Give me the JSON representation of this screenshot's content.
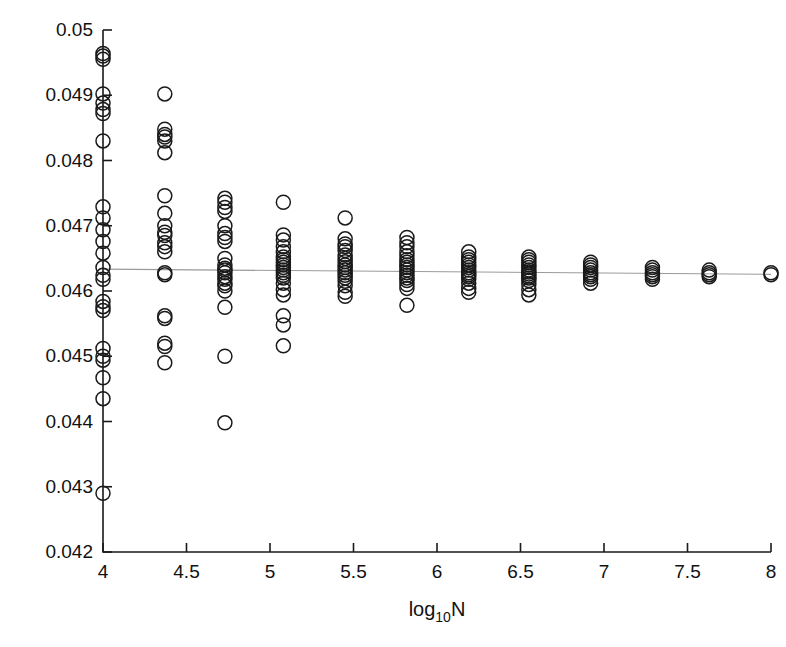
{
  "chart_data": {
    "type": "scatter",
    "title": "",
    "subtitle": "",
    "xlabel": "log10N",
    "xlabel_parts": {
      "base": "log",
      "subscript": "10",
      "tail": "N"
    },
    "ylabel": "",
    "xlim": [
      4,
      8
    ],
    "ylim": [
      0.042,
      0.05
    ],
    "xticks": [
      4,
      4.5,
      5,
      5.5,
      6,
      6.5,
      7,
      7.5,
      8
    ],
    "xtick_labels": [
      "4",
      "4.5",
      "5",
      "5.5",
      "6",
      "6.5",
      "7",
      "7.5",
      "8"
    ],
    "yticks": [
      0.042,
      0.043,
      0.044,
      0.045,
      0.046,
      0.047,
      0.048,
      0.049,
      0.05
    ],
    "ytick_labels": [
      "0.042",
      "0.043",
      "0.044",
      "0.045",
      "0.046",
      "0.047",
      "0.048",
      "0.049",
      "0.05"
    ],
    "grid": false,
    "legend": null,
    "legend_position": "none",
    "marker": {
      "shape": "circle",
      "fill": "none",
      "edge_color": "#1a1a1a",
      "radius_px": 7
    },
    "reference_line": {
      "kind": "horizontal-trend",
      "color": "#9a9a9a",
      "y_at_xmin": 0.046335,
      "y_at_xmax": 0.046255
    },
    "groups": [
      {
        "x": 4.0,
        "values": [
          0.04964,
          0.0496,
          0.04955,
          0.04902,
          0.04888,
          0.04878,
          0.04872,
          0.0483,
          0.04729,
          0.04712,
          0.04694,
          0.04676,
          0.04658,
          0.04636,
          0.04624,
          0.04618,
          0.04584,
          0.04576,
          0.0457,
          0.04512,
          0.045,
          0.04494,
          0.04467,
          0.04435,
          0.0429
        ]
      },
      {
        "x": 4.37,
        "values": [
          0.04902,
          0.04848,
          0.0484,
          0.04836,
          0.0483,
          0.04812,
          0.04746,
          0.04719,
          0.047,
          0.0469,
          0.04685,
          0.04674,
          0.04668,
          0.0466,
          0.04628,
          0.04625,
          0.04562,
          0.04558,
          0.0452,
          0.04515,
          0.0449
        ]
      },
      {
        "x": 4.73,
        "values": [
          0.04742,
          0.04736,
          0.04728,
          0.04722,
          0.047,
          0.04688,
          0.04682,
          0.04676,
          0.0465,
          0.0464,
          0.04635,
          0.04632,
          0.04628,
          0.04622,
          0.04618,
          0.04612,
          0.04608,
          0.046,
          0.04575,
          0.045,
          0.04398
        ]
      },
      {
        "x": 5.08,
        "values": [
          0.04736,
          0.04686,
          0.04678,
          0.04668,
          0.0466,
          0.04652,
          0.04648,
          0.04644,
          0.0464,
          0.04636,
          0.04632,
          0.04628,
          0.04624,
          0.0462,
          0.04612,
          0.04602,
          0.04594,
          0.04562,
          0.04548,
          0.04516
        ]
      },
      {
        "x": 5.45,
        "values": [
          0.04712,
          0.0468,
          0.04672,
          0.04668,
          0.04662,
          0.04655,
          0.0465,
          0.04645,
          0.0464,
          0.04636,
          0.04632,
          0.04628,
          0.04624,
          0.0462,
          0.04615,
          0.04608,
          0.04598,
          0.04592
        ]
      },
      {
        "x": 5.82,
        "values": [
          0.04682,
          0.04674,
          0.04668,
          0.0466,
          0.04654,
          0.04648,
          0.04644,
          0.0464,
          0.04636,
          0.04632,
          0.04628,
          0.04624,
          0.0462,
          0.04616,
          0.0461,
          0.04604,
          0.04578
        ]
      },
      {
        "x": 6.19,
        "values": [
          0.0466,
          0.04652,
          0.04648,
          0.04644,
          0.0464,
          0.04636,
          0.04632,
          0.04628,
          0.04625,
          0.04622,
          0.04618,
          0.04612,
          0.04604,
          0.04598
        ]
      },
      {
        "x": 6.55,
        "values": [
          0.04652,
          0.04648,
          0.04644,
          0.0464,
          0.04636,
          0.04632,
          0.04629,
          0.04626,
          0.04623,
          0.0462,
          0.04616,
          0.0461,
          0.04602,
          0.04594
        ]
      },
      {
        "x": 6.92,
        "values": [
          0.04644,
          0.0464,
          0.04636,
          0.04632,
          0.04628,
          0.04625,
          0.04622,
          0.04618,
          0.04612
        ]
      },
      {
        "x": 7.29,
        "values": [
          0.04636,
          0.04632,
          0.04628,
          0.04625,
          0.04622,
          0.04618
        ]
      },
      {
        "x": 7.63,
        "values": [
          0.04632,
          0.04628,
          0.04625,
          0.04622
        ]
      },
      {
        "x": 8.0,
        "values": [
          0.04628,
          0.04625
        ]
      }
    ]
  }
}
